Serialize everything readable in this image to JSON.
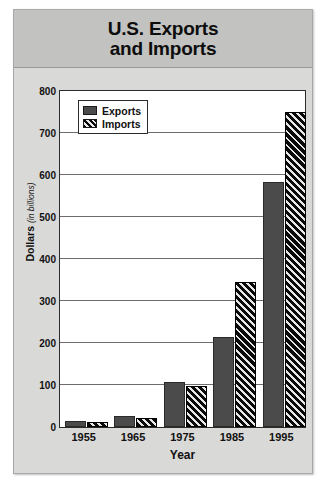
{
  "card": {
    "title_line1": "U.S. Exports",
    "title_line2": "and Imports"
  },
  "chart_data": {
    "type": "bar",
    "title": "U.S. Exports and Imports",
    "categories": [
      "1955",
      "1965",
      "1975",
      "1985",
      "1995"
    ],
    "series": [
      {
        "name": "Exports",
        "values": [
          15,
          27,
          107,
          215,
          583
        ],
        "color": "#4b4b4b",
        "fill": "solid"
      },
      {
        "name": "Imports",
        "values": [
          12,
          22,
          98,
          345,
          750
        ],
        "color": "#0a0a0a",
        "fill": "diagonal-hatch"
      }
    ],
    "xlabel": "Year",
    "ylabel": "Dollars",
    "ylabel_unit": "(in billions)",
    "ylim": [
      0,
      800
    ],
    "ytick_values": [
      0,
      100,
      200,
      300,
      400,
      500,
      600,
      700,
      800
    ],
    "ytick_labels": [
      "0",
      "100",
      "200",
      "300",
      "400",
      "500",
      "600",
      "700",
      "800"
    ],
    "grid": true,
    "legend_position": "top-left"
  }
}
